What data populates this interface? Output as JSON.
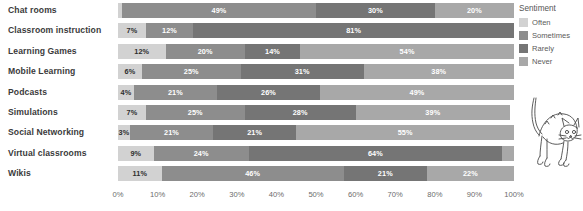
{
  "chart_data": {
    "type": "bar",
    "orientation": "horizontal",
    "stacked": true,
    "stack_mode": "percent",
    "title": "",
    "subtitle": "",
    "xlabel": "",
    "ylabel": "",
    "xlim": [
      0,
      100
    ],
    "grid": false,
    "legend_position": "right",
    "legend_title": "Sentiment",
    "categories": [
      "Chat rooms",
      "Classroom instruction",
      "Learning Games",
      "Mobile Learning",
      "Podcasts",
      "Simulations",
      "Social Networking",
      "Virtual classrooms",
      "Wikis"
    ],
    "series": [
      {
        "name": "Often",
        "color": "#d2d2d2",
        "values": [
          1,
          7,
          12,
          6,
          4,
          7,
          3,
          9,
          11
        ],
        "labels": [
          "",
          "7%",
          "12%",
          "6%",
          "4%",
          "7%",
          "3%",
          "9%",
          "11%"
        ]
      },
      {
        "name": "Sometimes",
        "color": "#8d8d8d",
        "values": [
          49,
          12,
          20,
          25,
          21,
          25,
          21,
          24,
          46
        ],
        "labels": [
          "49%",
          "12%",
          "20%",
          "25%",
          "21%",
          "25%",
          "21%",
          "24%",
          "46%"
        ]
      },
      {
        "name": "Rarely",
        "color": "#757575",
        "values": [
          30,
          81,
          14,
          31,
          26,
          28,
          21,
          64,
          21
        ],
        "labels": [
          "30%",
          "81%",
          "14%",
          "31%",
          "26%",
          "28%",
          "21%",
          "64%",
          "21%"
        ]
      },
      {
        "name": "Never",
        "color": "#a8a8a8",
        "values": [
          20,
          0,
          54,
          38,
          49,
          39,
          55,
          3,
          22
        ],
        "labels": [
          "20%",
          "",
          "54%",
          "38%",
          "49%",
          "39%",
          "55%",
          "",
          "22%"
        ]
      }
    ],
    "xticks": [
      "0%",
      "10%",
      "20%",
      "30%",
      "40%",
      "50%",
      "60%",
      "70%",
      "80%",
      "90%",
      "100%"
    ],
    "xtick_values": [
      0,
      10,
      20,
      30,
      40,
      50,
      60,
      70,
      80,
      90,
      100
    ]
  },
  "legend": {
    "title": "Sentiment",
    "items": [
      {
        "label": "Often",
        "swatch_class": "s-often"
      },
      {
        "label": "Sometimes",
        "swatch_class": "s-some"
      },
      {
        "label": "Rarely",
        "swatch_class": "s-rarely"
      },
      {
        "label": "Never",
        "swatch_class": "s-never"
      }
    ]
  },
  "decoration": {
    "cat_illustration": "arched-cat-line-drawing"
  },
  "colors": {
    "often": "#d2d2d2",
    "sometimes": "#8d8d8d",
    "rarely": "#757575",
    "never": "#a8a8a8",
    "label_text": "#3b3b3b",
    "axis_text": "#6b6b6b",
    "background": "#ffffff"
  }
}
